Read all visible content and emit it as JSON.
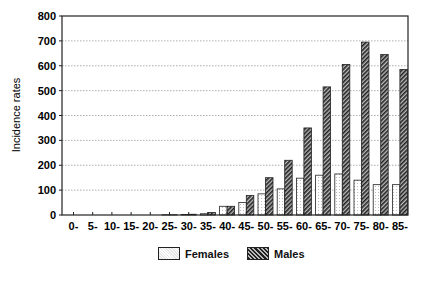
{
  "chart_data": {
    "type": "bar",
    "title": "",
    "xlabel": "",
    "ylabel": "Incidence rates",
    "ylim": [
      0,
      800
    ],
    "yticks": [
      0,
      100,
      200,
      300,
      400,
      500,
      600,
      700,
      800
    ],
    "grid": "horizontal dotted",
    "legend_position": "bottom-center",
    "categories": [
      "0-",
      "5-",
      "10-",
      "15-",
      "20-",
      "25-",
      "30-",
      "35-",
      "40-",
      "45-",
      "50-",
      "55-",
      "60-",
      "65-",
      "70-",
      "75-",
      "80-",
      "85-"
    ],
    "series": [
      {
        "name": "Females",
        "pattern": "light-dotted",
        "values": [
          0,
          0,
          0,
          0,
          0,
          1,
          2,
          5,
          35,
          50,
          85,
          105,
          148,
          160,
          165,
          140,
          122,
          122
        ]
      },
      {
        "name": "Males",
        "pattern": "dark-hatched",
        "values": [
          0,
          0,
          0,
          0,
          0,
          1,
          3,
          10,
          35,
          78,
          150,
          220,
          350,
          515,
          605,
          695,
          645,
          585
        ]
      }
    ]
  },
  "legend": {
    "females": "Females",
    "males": "Males"
  }
}
